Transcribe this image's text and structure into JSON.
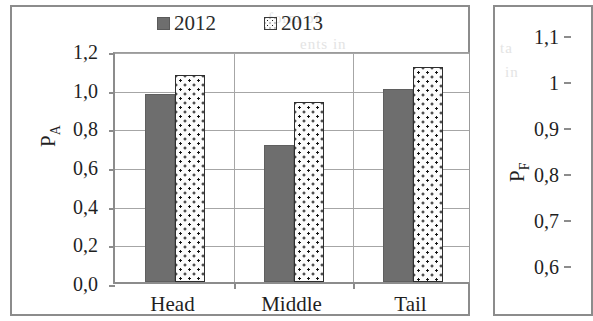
{
  "figure": {
    "panels": [
      {
        "id": "panel-left",
        "legend": [
          {
            "label": "2012",
            "swatch": "solid-gray-square",
            "color": "#6e6e6e"
          },
          {
            "label": "2013",
            "swatch": "dotted-pattern-square",
            "color": "#fcfcfc"
          }
        ]
      },
      {
        "id": "panel-right",
        "clipped": "true"
      }
    ]
  },
  "chart_data": [
    {
      "type": "bar",
      "title": "",
      "xlabel": "",
      "ylabel": "P_A",
      "ylabel_base": "P",
      "ylabel_sub": "A",
      "categories": [
        "Head",
        "Middle",
        "Tail"
      ],
      "ytick_labels": [
        "0,0",
        "0,2",
        "0,4",
        "0,6",
        "0,8",
        "1,0",
        "1,2"
      ],
      "ytick_values": [
        0.0,
        0.2,
        0.4,
        0.6,
        0.8,
        1.0,
        1.2
      ],
      "ylim": [
        0,
        1.2
      ],
      "grid": "horizontal",
      "legend_position": "top-center",
      "series": [
        {
          "name": "2012",
          "values": [
            0.97,
            0.71,
            1.0
          ],
          "fill": "solid",
          "color": "#6e6e6e"
        },
        {
          "name": "2013",
          "values": [
            1.07,
            0.93,
            1.11
          ],
          "fill": "dotted",
          "color": "#fcfcfc"
        }
      ]
    },
    {
      "type": "bar",
      "title": "",
      "xlabel": "",
      "ylabel": "P_F",
      "ylabel_base": "P",
      "ylabel_sub": "F",
      "categories": [],
      "ytick_labels": [
        "1,1",
        "1",
        "0,9",
        "0,8",
        "0,7",
        "0,6"
      ],
      "ytick_values": [
        1.1,
        1.0,
        0.9,
        0.8,
        0.7,
        0.6
      ],
      "ylim": [
        0.6,
        1.1
      ],
      "grid": "none",
      "legend_position": "none",
      "series": []
    }
  ],
  "bleed_text": [
    {
      "text": "form of",
      "x": 268,
      "y": 18
    },
    {
      "text": "ents in",
      "x": 300,
      "y": 44
    },
    {
      "text": "ta",
      "x": 500,
      "y": 48
    },
    {
      "text": "in",
      "x": 505,
      "y": 72
    }
  ]
}
